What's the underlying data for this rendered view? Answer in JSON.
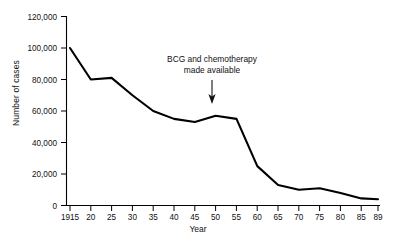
{
  "chart_data": {
    "type": "line",
    "title": "",
    "xlabel": "Year",
    "ylabel": "Number of cases",
    "xlim": [
      1915,
      1989
    ],
    "ylim": [
      0,
      120000
    ],
    "grid": false,
    "legend": null,
    "x_tick_labels": [
      "1915",
      "20",
      "25",
      "30",
      "35",
      "40",
      "45",
      "50",
      "55",
      "60",
      "65",
      "70",
      "75",
      "80",
      "85",
      "89"
    ],
    "x_tick_values": [
      1915,
      1920,
      1925,
      1930,
      1935,
      1940,
      1945,
      1950,
      1955,
      1960,
      1965,
      1970,
      1975,
      1980,
      1985,
      1989
    ],
    "y_tick_labels": [
      "0",
      "20,000",
      "40,000",
      "60,000",
      "80,000",
      "100,000",
      "120,000"
    ],
    "y_tick_values": [
      0,
      20000,
      40000,
      60000,
      80000,
      100000,
      120000
    ],
    "x": [
      1915,
      1920,
      1925,
      1930,
      1935,
      1940,
      1945,
      1950,
      1955,
      1960,
      1965,
      1970,
      1975,
      1980,
      1985,
      1989
    ],
    "values": [
      100000,
      80000,
      81000,
      70000,
      60000,
      55000,
      53000,
      57000,
      55000,
      25000,
      13000,
      10000,
      11000,
      8000,
      4500,
      4000
    ],
    "series": [
      {
        "name": "Number of cases",
        "values": [
          100000,
          80000,
          81000,
          70000,
          60000,
          55000,
          53000,
          57000,
          55000,
          25000,
          13000,
          10000,
          11000,
          8000,
          4500,
          4000
        ]
      }
    ],
    "annotations": [
      {
        "text_line_1": "BCG and chemotherapy",
        "text_line_2": "made available",
        "arrow": "down-arrow",
        "points_to_year": 1950
      }
    ],
    "line_color": "#000000"
  }
}
